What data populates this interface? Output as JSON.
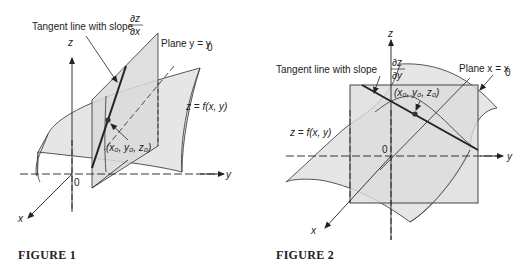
{
  "figure1": {
    "caption": "FIGURE 1",
    "tangent_label": "Tangent line with slope",
    "slope_num": "∂z",
    "slope_den": "∂x",
    "plane_label": "Plane y = y",
    "plane_sub": "0",
    "surface_label": "z = f(x, y)",
    "point_label": "(x₀, y₀, z₀)",
    "axis_z": "z",
    "axis_y": "y",
    "axis_x": "x",
    "origin": "0"
  },
  "figure2": {
    "caption": "FIGURE 2",
    "tangent_label": "Tangent line with slope",
    "slope_num": "∂z",
    "slope_den": "∂y",
    "plane_label": "Plane x = x",
    "plane_sub": "0",
    "surface_label": "z = f(x, y)",
    "point_label": "(x₀, y₀, z₀)",
    "axis_z": "z",
    "axis_y": "y",
    "axis_x": "x",
    "origin": "0"
  },
  "colors": {
    "surface_fill": "#e4e4e4",
    "plane_fill": "#d6d6d6",
    "line": "#333333"
  }
}
